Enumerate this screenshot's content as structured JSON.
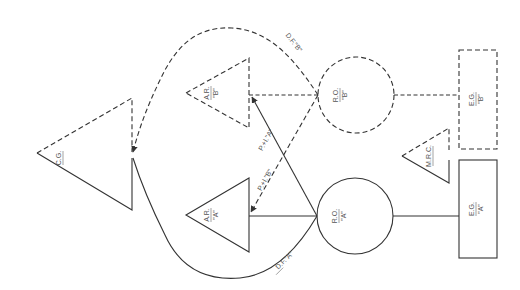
{
  "diagram": {
    "orientation": "rotated 90 degrees counter-clockwise (labels read bottom-to-top)",
    "nodes": [
      {
        "id": "cg",
        "shape": "triangle",
        "label_top": "C.G.",
        "label_bottom": "",
        "style": "half-dashed / half-solid"
      },
      {
        "id": "ar_b",
        "shape": "triangle",
        "label_top": "A.R.",
        "label_bottom": "\"B\"",
        "style": "dashed"
      },
      {
        "id": "ar_a",
        "shape": "triangle",
        "label_top": "A.R.",
        "label_bottom": "\"A\"",
        "style": "solid"
      },
      {
        "id": "ro_b",
        "shape": "circle",
        "label_top": "R.O.",
        "label_bottom": "\"B\"",
        "style": "dashed"
      },
      {
        "id": "ro_a",
        "shape": "circle",
        "label_top": "R.O.",
        "label_bottom": "\"A\"",
        "style": "solid"
      },
      {
        "id": "eg_b",
        "shape": "rectangle",
        "label_top": "E.G.",
        "label_bottom": "\"B\"",
        "style": "dashed"
      },
      {
        "id": "eg_a",
        "shape": "rectangle",
        "label_top": "E.G.",
        "label_bottom": "\"A\"",
        "style": "solid"
      },
      {
        "id": "mrc",
        "shape": "triangle",
        "label_top": "M.R.C.",
        "label_bottom": "",
        "style": "half-dashed / half-solid"
      }
    ],
    "edges": [
      {
        "from": "ro_b",
        "to": "cg",
        "label": "D.F.\"B\"",
        "style": "dashed",
        "arrow": true
      },
      {
        "from": "ro_a",
        "to": "cg",
        "label": "D.F.\"A\"",
        "style": "solid",
        "arrow": true
      },
      {
        "from": "ro_a",
        "to": "ar_b",
        "label": "P.+I.\"A\"",
        "style": "solid",
        "arrow": true
      },
      {
        "from": "ro_b",
        "to": "ar_a",
        "label": "P.+I.\"B\"",
        "style": "dashed",
        "arrow": true
      },
      {
        "from": "ro_b",
        "to": "ar_b",
        "label": "",
        "style": "dashed",
        "arrow": false
      },
      {
        "from": "ro_a",
        "to": "ar_a",
        "label": "",
        "style": "solid",
        "arrow": false
      },
      {
        "from": "ro_b",
        "to": "eg_b",
        "label": "",
        "style": "dashed",
        "arrow": false
      },
      {
        "from": "ro_a",
        "to": "eg_a",
        "label": "",
        "style": "solid",
        "arrow": false
      }
    ],
    "labels": {
      "cg": "C.G.",
      "ar_b_top": "A.R.",
      "ar_b_bottom": "\"B\"",
      "ar_a_top": "A.R.",
      "ar_a_bottom": "\"A\"",
      "ro_b_top": "R.O.",
      "ro_b_bottom": "\"B\"",
      "ro_a_top": "R.O.",
      "ro_a_bottom": "\"A\"",
      "eg_b_top": "E.G.",
      "eg_b_bottom": "\"B\"",
      "eg_a_top": "E.G.",
      "eg_a_bottom": "\"A\"",
      "mrc": "M.R.C.",
      "df_b": "D.F.\"B\"",
      "df_a": "D.F.\"A\"",
      "pi_a": "P.+I.\"A\"",
      "pi_b": "P.+I.\"B\""
    },
    "colors": {
      "line": "#333333",
      "text": "#555555",
      "background": "#ffffff"
    }
  }
}
